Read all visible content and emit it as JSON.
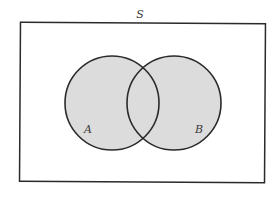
{
  "diagram": {
    "type": "venn",
    "universe_label": "S",
    "sets": [
      {
        "label": "A",
        "cx": 112,
        "cy": 103,
        "r": 47
      },
      {
        "label": "B",
        "cx": 174,
        "cy": 103,
        "r": 47
      }
    ],
    "universe_rect": {
      "x": 20,
      "y": 23,
      "width": 245,
      "height": 159
    },
    "colors": {
      "fill": "#dcdcdc",
      "stroke": "#2a2a2a",
      "background": "#ffffff"
    },
    "shaded_region": "A ∪ B"
  }
}
